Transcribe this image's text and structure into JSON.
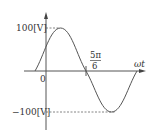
{
  "diagram": {
    "type": "sine-waveform",
    "axes": {
      "x_label": "ωt",
      "origin_label": "0"
    },
    "labels": {
      "max": "100[V]",
      "min": "−100[V]",
      "tick_numerator": "5π",
      "tick_denominator": "6"
    },
    "waveform": {
      "amplitude_V": 100,
      "phase_shift": "π/6",
      "zero_crossing_marked": "5π/6"
    },
    "colors": {
      "line": "#555555",
      "axis": "#444444"
    }
  }
}
